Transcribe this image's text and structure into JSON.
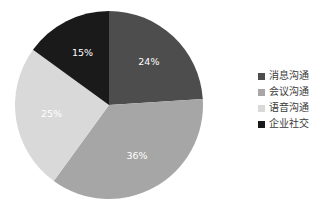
{
  "chart_data": {
    "type": "pie",
    "title": "",
    "subtitle": "",
    "xlabel": "",
    "ylabel": "",
    "grid": false,
    "legend_position": "right",
    "start_angle_deg": 0,
    "direction": "clockwise",
    "categories": [
      "消息沟通",
      "会议沟通",
      "语音沟通",
      "企业社交"
    ],
    "values": [
      24,
      36,
      25,
      15
    ],
    "unit": "%",
    "data_labels": [
      "24%",
      "36%",
      "25%",
      "15%"
    ],
    "colors": [
      "#4d4d4d",
      "#a6a6a6",
      "#d9d9d9",
      "#1a1a1a"
    ],
    "slices": [
      {
        "label": "消息沟通",
        "value": 24,
        "data_label": "24%",
        "color": "#4d4d4d",
        "label_color": "#ffffff"
      },
      {
        "label": "会议沟通",
        "value": 36,
        "data_label": "36%",
        "color": "#a6a6a6",
        "label_color": "#ffffff"
      },
      {
        "label": "语音沟通",
        "value": 25,
        "data_label": "25%",
        "color": "#d9d9d9",
        "label_color": "#ffffff"
      },
      {
        "label": "企业社交",
        "value": 15,
        "data_label": "15%",
        "color": "#1a1a1a",
        "label_color": "#ffffff"
      }
    ]
  },
  "legend": {
    "items": [
      {
        "label": "消息沟通",
        "color": "#4d4d4d",
        "marker": "square-marker-icon"
      },
      {
        "label": "会议沟通",
        "color": "#a6a6a6",
        "marker": "square-marker-icon"
      },
      {
        "label": "语音沟通",
        "color": "#d9d9d9",
        "marker": "square-marker-icon"
      },
      {
        "label": "企业社交",
        "color": "#1a1a1a",
        "marker": "square-marker-icon"
      }
    ]
  },
  "canvas": {
    "background": "#ffffff",
    "width": 328,
    "height": 218
  }
}
